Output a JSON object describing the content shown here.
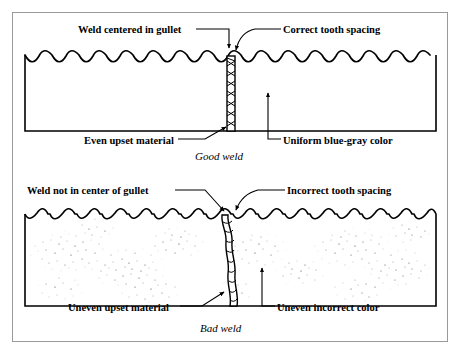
{
  "figure": {
    "frame_color": "#9a9a9a",
    "ink_color": "#000000",
    "background": "#ffffff"
  },
  "panels": [
    {
      "id": "good-weld",
      "caption": "Good weld",
      "labels": {
        "top_left": "Weld centered in gullet",
        "top_right": "Correct tooth spacing",
        "bottom_left": "Even upset material",
        "bottom_right": "Uniform blue-gray color"
      },
      "blade": {
        "tooth_count": 15,
        "tooth_style": "even-rounded-gullet",
        "seam_style": "regular-cross-hatch",
        "surface_texture": "uniform-clean"
      }
    },
    {
      "id": "bad-weld",
      "caption": "Bad weld",
      "labels": {
        "top_left": "Weld not in center of gullet",
        "top_right": "Incorrect tooth spacing",
        "bottom_left": "Uneven upset material",
        "bottom_right": "Uneven incorrect color"
      },
      "blade": {
        "tooth_count": 15,
        "tooth_style": "uneven-hooked-gullet",
        "seam_style": "irregular-lumpy",
        "surface_texture": "blotchy-stipple"
      }
    }
  ]
}
